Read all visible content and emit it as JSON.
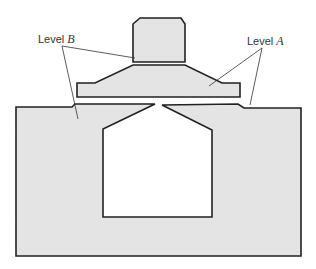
{
  "diagram": {
    "labels": {
      "level_b": {
        "prefix": "Level ",
        "var": "B"
      },
      "level_a": {
        "prefix": "Level ",
        "var": "A"
      }
    },
    "colors": {
      "fill": "#e4e4e4",
      "stroke": "#222222",
      "leader": "#333333",
      "background": "#ffffff"
    },
    "parts": [
      "top-block",
      "middle-plate",
      "base-left",
      "base-right",
      "central-cavity"
    ]
  }
}
